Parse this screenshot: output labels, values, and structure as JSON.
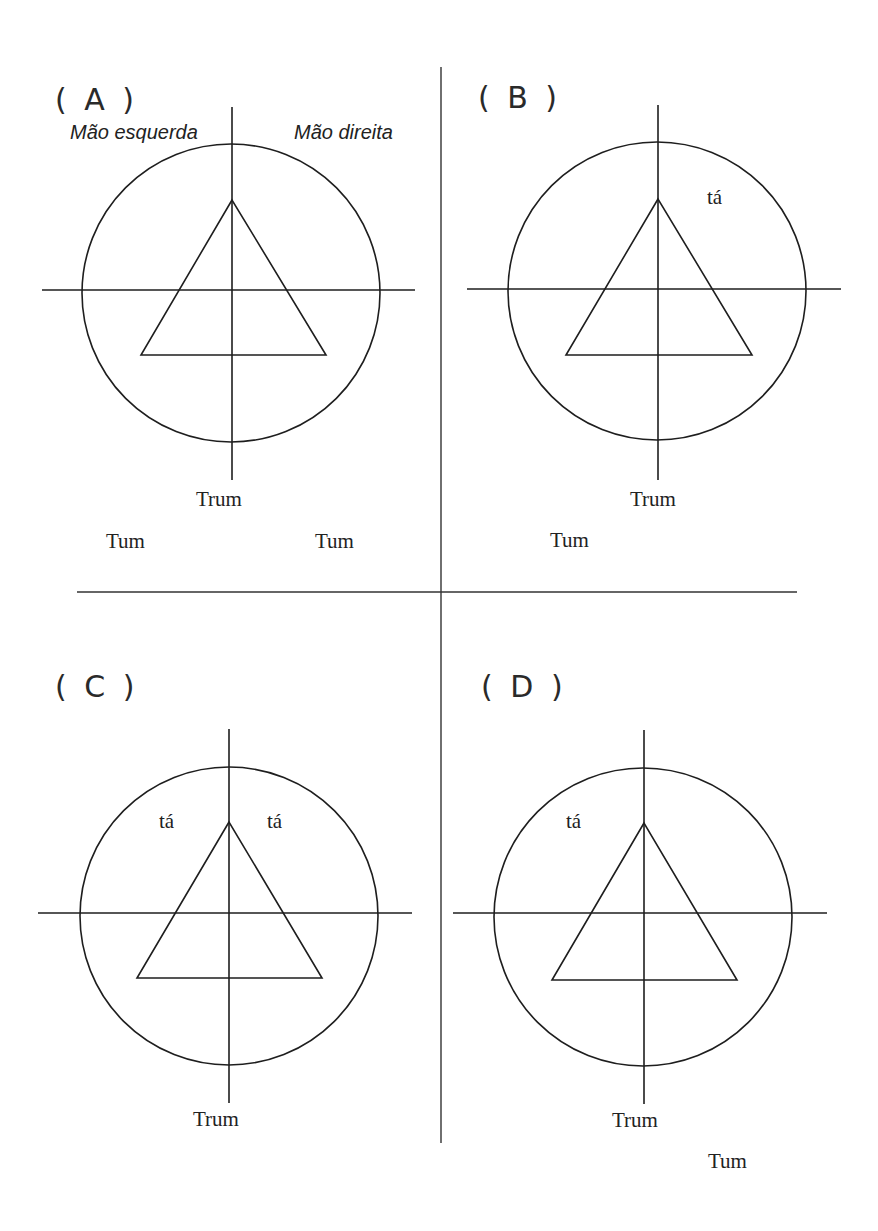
{
  "colors": {
    "ink": "#1e1e1e",
    "background": "#ffffff"
  },
  "dividers": {
    "vertical": {
      "x": 441,
      "y1": 67,
      "y2": 1143
    },
    "horizontal": {
      "y": 592,
      "x1": 77,
      "x2": 797
    }
  },
  "panels": [
    {
      "id": "A",
      "label": "( A )",
      "label_pos": {
        "x": 55,
        "y": 110
      },
      "axis": {
        "cx": 232,
        "cy": 290,
        "v_top": 107,
        "v_bottom": 480,
        "h_left": 42,
        "h_right": 415
      },
      "circle": {
        "cx": 231,
        "cy": 293,
        "r": 149
      },
      "triangle": {
        "apex": [
          232,
          200
        ],
        "base_left": [
          141,
          355
        ],
        "base_right": [
          326,
          355
        ]
      },
      "hand_labels": [
        {
          "text": "Mão esquerda",
          "x": 70,
          "y": 139
        },
        {
          "text": "Mão direita",
          "x": 294,
          "y": 139
        }
      ],
      "syllables": [
        {
          "text": "Trum",
          "x": 196,
          "y": 506
        },
        {
          "text": "Tum",
          "x": 106,
          "y": 548
        },
        {
          "text": "Tum",
          "x": 315,
          "y": 548
        }
      ]
    },
    {
      "id": "B",
      "label": "( B )",
      "label_pos": {
        "x": 478,
        "y": 108
      },
      "axis": {
        "cx": 658,
        "cy": 289,
        "v_top": 105,
        "v_bottom": 480,
        "h_left": 467,
        "h_right": 841
      },
      "circle": {
        "cx": 657,
        "cy": 291,
        "r": 149
      },
      "triangle": {
        "apex": [
          658,
          199
        ],
        "base_left": [
          566,
          355
        ],
        "base_right": [
          752,
          355
        ]
      },
      "hand_labels": [],
      "syllables": [
        {
          "text": "tá",
          "x": 707,
          "y": 204
        },
        {
          "text": "Trum",
          "x": 630,
          "y": 506
        },
        {
          "text": "Tum",
          "x": 550,
          "y": 547
        }
      ]
    },
    {
      "id": "C",
      "label": "( C )",
      "label_pos": {
        "x": 55,
        "y": 697
      },
      "axis": {
        "cx": 229,
        "cy": 913,
        "v_top": 729,
        "v_bottom": 1103,
        "h_left": 38,
        "h_right": 412
      },
      "circle": {
        "cx": 229,
        "cy": 916,
        "r": 149
      },
      "triangle": {
        "apex": [
          229,
          822
        ],
        "base_left": [
          137,
          978
        ],
        "base_right": [
          322,
          978
        ]
      },
      "hand_labels": [],
      "syllables": [
        {
          "text": "tá",
          "x": 159,
          "y": 828
        },
        {
          "text": "tá",
          "x": 267,
          "y": 828
        },
        {
          "text": "Trum",
          "x": 193,
          "y": 1126
        }
      ]
    },
    {
      "id": "D",
      "label": "( D )",
      "label_pos": {
        "x": 481,
        "y": 697
      },
      "axis": {
        "cx": 644,
        "cy": 913,
        "v_top": 730,
        "v_bottom": 1104,
        "h_left": 453,
        "h_right": 827
      },
      "circle": {
        "cx": 643,
        "cy": 917,
        "r": 149
      },
      "triangle": {
        "apex": [
          644,
          823
        ],
        "base_left": [
          552,
          980
        ],
        "base_right": [
          737,
          980
        ]
      },
      "hand_labels": [],
      "syllables": [
        {
          "text": "tá",
          "x": 566,
          "y": 828
        },
        {
          "text": "Trum",
          "x": 612,
          "y": 1127
        },
        {
          "text": "Tum",
          "x": 708,
          "y": 1168
        }
      ]
    }
  ]
}
